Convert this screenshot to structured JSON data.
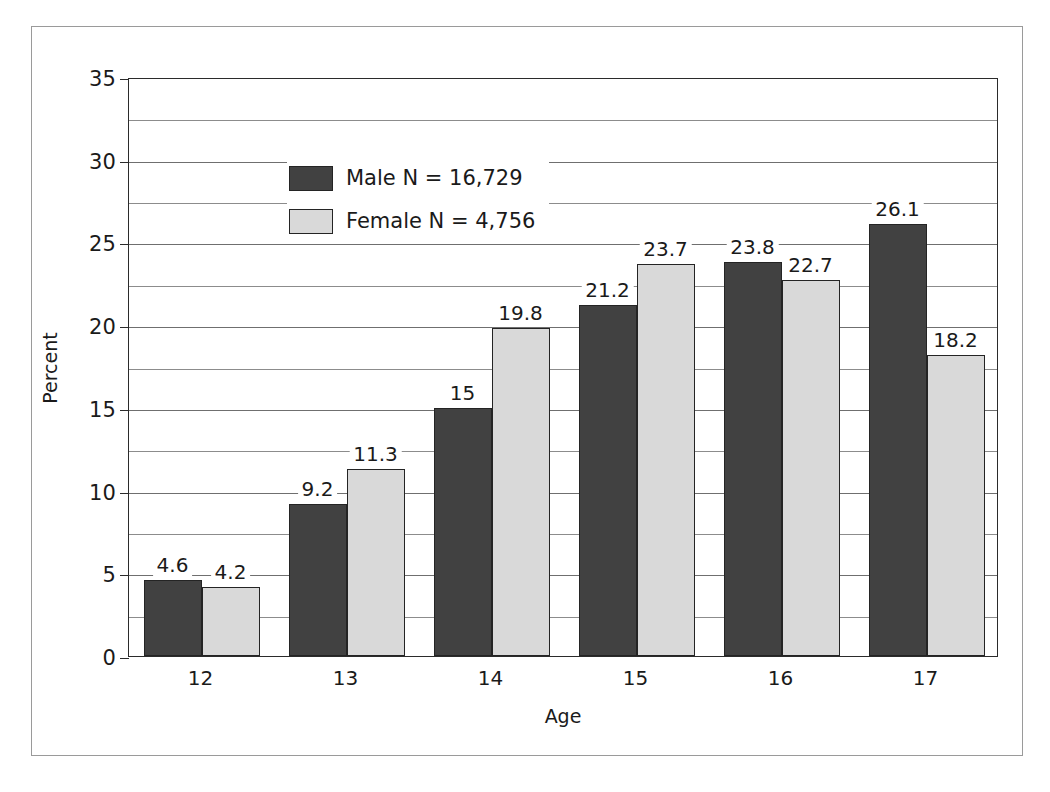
{
  "chart_data": {
    "type": "bar",
    "title": "",
    "xlabel": "Age",
    "ylabel": "Percent",
    "categories": [
      "12",
      "13",
      "14",
      "15",
      "16",
      "17"
    ],
    "series": [
      {
        "name": "Male N = 16,729",
        "short_name": "Male",
        "color": "#414141",
        "values": [
          4.6,
          9.2,
          15,
          21.2,
          23.8,
          26.1
        ],
        "labels": [
          "4.6",
          "9.2",
          "15",
          "21.2",
          "23.8",
          "26.1"
        ]
      },
      {
        "name": "Female N = 4,756",
        "short_name": "Female",
        "color": "#d9d9d9",
        "values": [
          4.2,
          11.3,
          19.8,
          23.7,
          22.7,
          18.2
        ],
        "labels": [
          "4.2",
          "11.3",
          "19.8",
          "23.7",
          "22.7",
          "18.2"
        ]
      }
    ],
    "ylim": [
      0,
      35
    ],
    "y_major_ticks": [
      0,
      5,
      10,
      15,
      20,
      25,
      30,
      35
    ],
    "y_major_tick_labels": [
      "0",
      "5",
      "10",
      "15",
      "20",
      "25",
      "30",
      "35"
    ],
    "y_minor_ticks": [
      2.5,
      7.5,
      12.5,
      17.5,
      22.5,
      27.5,
      32.5
    ],
    "grid": true,
    "legend_position": "top-left",
    "bar_outline_color": "#242424",
    "axis_color": "#2b2b2b",
    "gridline_color": "#6f6f6f"
  },
  "legend": {
    "entries": [
      {
        "label": "Male N = 16,729"
      },
      {
        "label": "Female N = 4,756"
      }
    ]
  },
  "axes": {
    "y_title": "Percent",
    "x_title": "Age"
  }
}
